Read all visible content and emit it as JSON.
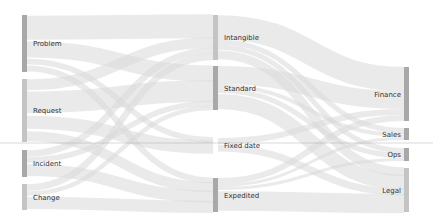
{
  "chart_data": {
    "type": "sankey",
    "title": "",
    "columns": [
      [
        "Problem",
        "Request",
        "Incident",
        "Change"
      ],
      [
        "Intangible",
        "Standard",
        "Fixed date",
        "Expedited"
      ],
      [
        "Finance",
        "Sales",
        "Ops",
        "Legal"
      ]
    ],
    "nodes": [
      {
        "id": "problem",
        "label": "Problem",
        "col": 0,
        "y0": 15,
        "y1": 72,
        "shade": "dark"
      },
      {
        "id": "request",
        "label": "Request",
        "col": 0,
        "y0": 79,
        "y1": 142,
        "shade": "light"
      },
      {
        "id": "incident",
        "label": "Incident",
        "col": 0,
        "y0": 150,
        "y1": 177,
        "shade": "dark"
      },
      {
        "id": "change",
        "label": "Change",
        "col": 0,
        "y0": 184,
        "y1": 210,
        "shade": "light"
      },
      {
        "id": "intangible",
        "label": "Intangible",
        "col": 1,
        "y0": 15,
        "y1": 60,
        "shade": "light"
      },
      {
        "id": "standard",
        "label": "Standard",
        "col": 1,
        "y0": 66,
        "y1": 110,
        "shade": "dark"
      },
      {
        "id": "fixed",
        "label": "Fixed date",
        "col": 1,
        "y0": 138,
        "y1": 152,
        "shade": "none"
      },
      {
        "id": "expedited",
        "label": "Expedited",
        "col": 1,
        "y0": 178,
        "y1": 212,
        "shade": "dark"
      },
      {
        "id": "finance",
        "label": "Finance",
        "col": 2,
        "y0": 67,
        "y1": 121,
        "shade": "dark"
      },
      {
        "id": "sales",
        "label": "Sales",
        "col": 2,
        "y0": 128,
        "y1": 140,
        "shade": "dark"
      },
      {
        "id": "ops",
        "label": "Ops",
        "col": 2,
        "y0": 148,
        "y1": 161,
        "shade": "dark"
      },
      {
        "id": "legal",
        "label": "Legal",
        "col": 2,
        "y0": 168,
        "y1": 212,
        "shade": "light"
      }
    ],
    "links": [
      {
        "source": "problem",
        "target": "intangible",
        "value": 22
      },
      {
        "source": "problem",
        "target": "standard",
        "value": 15
      },
      {
        "source": "problem",
        "target": "fixed",
        "value": 6
      },
      {
        "source": "problem",
        "target": "expedited",
        "value": 6
      },
      {
        "source": "request",
        "target": "intangible",
        "value": 10
      },
      {
        "source": "request",
        "target": "standard",
        "value": 20
      },
      {
        "source": "request",
        "target": "fixed",
        "value": 14
      },
      {
        "source": "request",
        "target": "expedited",
        "value": 10
      },
      {
        "source": "incident",
        "target": "intangible",
        "value": 6
      },
      {
        "source": "incident",
        "target": "standard",
        "value": 5
      },
      {
        "source": "incident",
        "target": "expedited",
        "value": 12
      },
      {
        "source": "change",
        "target": "intangible",
        "value": 6
      },
      {
        "source": "change",
        "target": "standard",
        "value": 4
      },
      {
        "source": "change",
        "target": "expedited",
        "value": 12
      },
      {
        "source": "intangible",
        "target": "finance",
        "value": 24
      },
      {
        "source": "intangible",
        "target": "sales",
        "value": 5
      },
      {
        "source": "intangible",
        "target": "ops",
        "value": 5
      },
      {
        "source": "intangible",
        "target": "legal",
        "value": 10
      },
      {
        "source": "standard",
        "target": "finance",
        "value": 18
      },
      {
        "source": "standard",
        "target": "sales",
        "value": 4
      },
      {
        "source": "standard",
        "target": "ops",
        "value": 5
      },
      {
        "source": "standard",
        "target": "legal",
        "value": 17
      },
      {
        "source": "fixed",
        "target": "finance",
        "value": 6
      },
      {
        "source": "fixed",
        "target": "legal",
        "value": 8
      },
      {
        "source": "expedited",
        "target": "finance",
        "value": 6
      },
      {
        "source": "expedited",
        "target": "sales",
        "value": 3
      },
      {
        "source": "expedited",
        "target": "ops",
        "value": 3
      },
      {
        "source": "expedited",
        "target": "legal",
        "value": 22
      }
    ],
    "layout": {
      "col_x": [
        22,
        213,
        404
      ],
      "node_width": 5,
      "guide_line_y": 143
    }
  }
}
